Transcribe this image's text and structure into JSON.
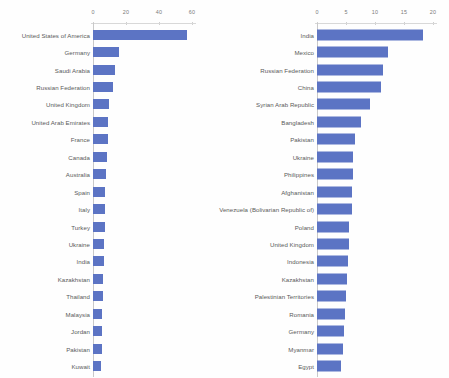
{
  "chart_data": [
    {
      "id": "left",
      "type": "bar",
      "orientation": "horizontal",
      "title": "",
      "xlabel": "",
      "ylabel": "",
      "xlim": [
        0,
        60
      ],
      "xticks": [
        0,
        20,
        40,
        60
      ],
      "xtick_labels": [
        "0",
        "20",
        "40",
        "60"
      ],
      "grid": false,
      "legend": "none",
      "series_color": "#5c74c4",
      "categories": [
        "United States of America",
        "Germany",
        "Saudi Arabia",
        "Russian Federation",
        "United Kingdom",
        "United Arab Emirates",
        "France",
        "Canada",
        "Australia",
        "Spain",
        "Italy",
        "Turkey",
        "Ukraine",
        "India",
        "Kazakhstan",
        "Thailand",
        "Malaysia",
        "Jordan",
        "Pakistan",
        "Kuwait"
      ],
      "values": [
        57.0,
        16.0,
        13.5,
        12.2,
        9.4,
        9.2,
        8.8,
        8.4,
        8.0,
        7.4,
        7.2,
        7.0,
        6.5,
        6.4,
        6.0,
        5.8,
        5.5,
        5.4,
        5.2,
        5.0
      ]
    },
    {
      "id": "right",
      "type": "bar",
      "orientation": "horizontal",
      "title": "",
      "xlabel": "",
      "ylabel": "",
      "xlim": [
        0,
        20
      ],
      "xticks": [
        0,
        5,
        10,
        15,
        20
      ],
      "xtick_labels": [
        "0",
        "5",
        "10",
        "15",
        "20"
      ],
      "grid": false,
      "legend": "none",
      "series_color": "#5c74c4",
      "categories": [
        "India",
        "Mexico",
        "Russian Federation",
        "China",
        "Syrian Arab Republic",
        "Bangladesh",
        "Pakistan",
        "Ukraine",
        "Philippines",
        "Afghanistan",
        "Venezuela (Bolivarian Republic of)",
        "Poland",
        "United Kingdom",
        "Indonesia",
        "Kazakhstan",
        "Palestinian Territories",
        "Romania",
        "Germany",
        "Myanmar",
        "Egypt"
      ],
      "values": [
        18.3,
        12.2,
        11.3,
        11.1,
        9.1,
        7.6,
        6.5,
        6.2,
        6.2,
        6.0,
        6.0,
        5.6,
        5.5,
        5.4,
        5.2,
        5.0,
        4.9,
        4.6,
        4.4,
        4.2
      ]
    }
  ]
}
